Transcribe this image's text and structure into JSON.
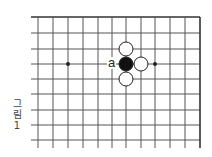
{
  "diagram": {
    "type": "go-board-partial",
    "caption": {
      "chars": [
        "그",
        "림",
        "1"
      ],
      "text": "그림 1"
    },
    "board": {
      "x_lines": [
        38,
        53,
        68,
        83,
        98,
        112,
        126,
        141,
        155,
        170,
        185,
        200
      ],
      "y_lines": [
        17,
        33,
        49,
        64,
        79,
        94,
        110,
        125,
        140
      ],
      "left_stub_x": 31,
      "bottom_extend_y": 148,
      "top_edge": true,
      "right_edge": true,
      "line_color": "#555555",
      "edge_color": "#333333"
    },
    "star_points": [
      {
        "x": 68,
        "y": 64
      },
      {
        "x": 155,
        "y": 64
      }
    ],
    "stones": [
      {
        "color": "black",
        "x": 126,
        "y": 64,
        "name": "black-stone-center"
      },
      {
        "color": "white",
        "x": 126,
        "y": 49,
        "name": "white-stone-top"
      },
      {
        "color": "white",
        "x": 141,
        "y": 64,
        "name": "white-stone-right"
      },
      {
        "color": "white",
        "x": 126,
        "y": 79,
        "name": "white-stone-bottom"
      }
    ],
    "labels": [
      {
        "text": "a",
        "x": 112,
        "y": 64
      }
    ]
  }
}
